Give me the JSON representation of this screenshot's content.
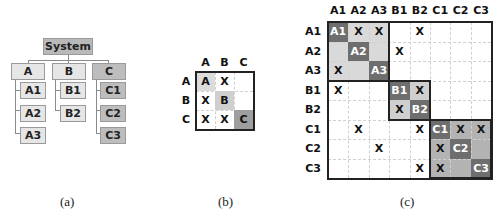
{
  "panel_a": {
    "caption": "(a)",
    "root": "System",
    "groups": [
      {
        "label": "A",
        "children": [
          "A1",
          "A2",
          "A3"
        ]
      },
      {
        "label": "B",
        "children": [
          "B1",
          "B2"
        ]
      },
      {
        "label": "C",
        "children": [
          "C1",
          "C2",
          "C3"
        ]
      }
    ]
  },
  "panel_b": {
    "caption": "(b)",
    "headers": [
      "A",
      "B",
      "C"
    ],
    "matrix": [
      [
        "A",
        "X",
        ""
      ],
      [
        "X",
        "B",
        ""
      ],
      [
        "X",
        "X",
        "C"
      ]
    ]
  },
  "panel_c": {
    "caption": "(c)",
    "headers": [
      "A1",
      "A2",
      "A3",
      "B1",
      "B2",
      "C1",
      "C2",
      "C3"
    ],
    "matrix": [
      [
        "A1",
        "X",
        "X",
        "",
        "X",
        "",
        "",
        ""
      ],
      [
        "",
        "A2",
        "",
        "X",
        "",
        "",
        "",
        ""
      ],
      [
        "X",
        "",
        "A3",
        "",
        "",
        "",
        "",
        ""
      ],
      [
        "X",
        "",
        "",
        "B1",
        "X",
        "",
        "",
        ""
      ],
      [
        "",
        "",
        "",
        "X",
        "B2",
        "",
        "",
        ""
      ],
      [
        "",
        "X",
        "",
        "",
        "X",
        "C1",
        "X",
        "X"
      ],
      [
        "",
        "",
        "X",
        "",
        "",
        "X",
        "C2",
        ""
      ],
      [
        "",
        "",
        "",
        "",
        "X",
        "X",
        "",
        "C3"
      ]
    ],
    "blocks": [
      {
        "name": "A",
        "start": 0,
        "end": 2
      },
      {
        "name": "B",
        "start": 3,
        "end": 4
      },
      {
        "name": "C",
        "start": 5,
        "end": 7
      }
    ]
  },
  "colors": {
    "block_a_fill": "#d9d9d9",
    "block_b_fill": "#cfcfcf",
    "block_c_fill": "#b3b3b3",
    "diag_dark": "#6e6e6e",
    "b_diag_a": "#dcdcdc",
    "b_diag_b": "#cfcfcf",
    "b_diag_c": "#9e9e9e"
  }
}
